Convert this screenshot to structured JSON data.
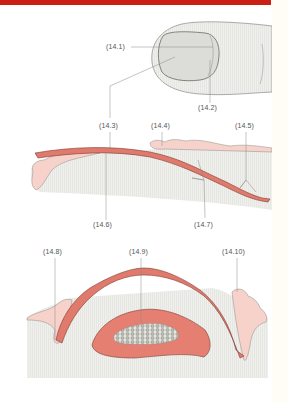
{
  "figure": {
    "header_bar_color": "#cc1f14",
    "colors": {
      "nail_plate": "#e07a6c",
      "nail_plate_edge": "#8a3a32",
      "tissue_pink": "#f6c9c0",
      "skin_fill": "#ecece8",
      "line": "#777777",
      "bone_fill": "#9aa09a"
    },
    "panels": [
      {
        "name": "fingertip-dorsal-view",
        "labels": [
          "(14.1)",
          "(14.2)"
        ]
      },
      {
        "name": "nail-longitudinal-section",
        "labels": [
          "(14.3)",
          "(14.4)",
          "(14.5)",
          "(14.6)",
          "(14.7)"
        ]
      },
      {
        "name": "nail-transverse-section",
        "labels": [
          "(14.8)",
          "(14.9)",
          "(14.10)"
        ]
      }
    ]
  },
  "labels": {
    "l14_1": "(14.1)",
    "l14_2": "(14.2)",
    "l14_3": "(14.3)",
    "l14_4": "(14.4)",
    "l14_5": "(14.5)",
    "l14_6": "(14.6)",
    "l14_7": "(14.7)",
    "l14_8": "(14.8)",
    "l14_9": "(14.9)",
    "l14_10": "(14.10)"
  }
}
